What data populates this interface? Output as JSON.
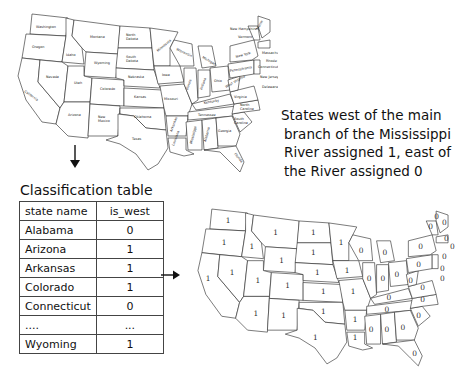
{
  "top_map": {
    "type": "labeled-us-map",
    "state_labels": [
      "Washington",
      "Oregon",
      "California",
      "Idaho",
      "Nevada",
      "Montana",
      "Wyoming",
      "Utah",
      "Arizona",
      "Colorado",
      "New Mexico",
      "North Dakota",
      "South Dakota",
      "Nebraska",
      "Kansas",
      "Oklahoma",
      "Texas",
      "Minnesota",
      "Iowa",
      "Missouri",
      "Arkansas",
      "Louisiana",
      "Wisconsin",
      "Illinois",
      "Michigan",
      "Indiana",
      "Ohio",
      "Kentucky",
      "Tennessee",
      "Mississippi",
      "Alabama",
      "Georgia",
      "Florida",
      "South Carolina",
      "North Carolina",
      "Virginia",
      "West Virginia",
      "Pennsylvania",
      "New York",
      "Vermont",
      "New Hampshire",
      "Maine",
      "Massachusetts",
      "Rhode Island",
      "Connecticut",
      "New Jersey",
      "Delaware",
      "Maryland"
    ]
  },
  "annotation": {
    "lines": [
      "States west of the main",
      "branch of the Mississippi",
      "River assigned 1, east of",
      "the River assigned 0"
    ]
  },
  "table": {
    "title": "Classification table",
    "headers": [
      "state name",
      "is_west"
    ],
    "rows": [
      [
        "Alabama",
        "0"
      ],
      [
        "Arizona",
        "1"
      ],
      [
        "Arkansas",
        "1"
      ],
      [
        "Colorado",
        "1"
      ],
      [
        "Connecticut",
        "0"
      ],
      [
        "....",
        "..."
      ],
      [
        "Wyoming",
        "1"
      ]
    ]
  },
  "bottom_map": {
    "type": "classified-us-map",
    "west_value": "1",
    "east_value": "0"
  },
  "arrows": [
    "down",
    "right"
  ]
}
